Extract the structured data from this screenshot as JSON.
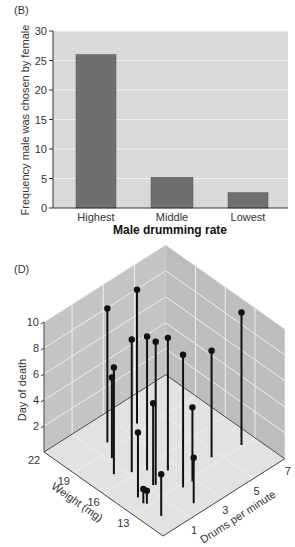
{
  "chart_data": [
    {
      "panel": "(B)",
      "type": "bar",
      "title": "",
      "xlabel": "Male drumming rate",
      "ylabel": "Frequency male was chosen by female",
      "categories": [
        "Highest",
        "Middle",
        "Lowest"
      ],
      "values": [
        26,
        5.2,
        2.6
      ],
      "ylim": [
        0,
        30
      ],
      "yticks": [
        0,
        5,
        10,
        15,
        20,
        25,
        30
      ],
      "grid": true,
      "colors": {
        "bar": "#6f6f6f",
        "background": "#d9d9d9",
        "grid": "#f2f2f2"
      }
    },
    {
      "panel": "(D)",
      "type": "scatter",
      "subtype": "3d-stem",
      "title": "",
      "xlabel": "Weight (mg)",
      "ylabel": "Drums per minute",
      "zlabel": "Day of death",
      "xticks": [
        22,
        19,
        16,
        13
      ],
      "yticks": [
        1,
        3,
        5,
        7
      ],
      "zticks": [
        2,
        4,
        6,
        8,
        10
      ],
      "xlim": [
        10,
        22
      ],
      "ylim": [
        -0.8,
        7
      ],
      "zlim": [
        0,
        10
      ],
      "grid": true,
      "points": [
        {
          "weight": 19.7,
          "drums": 1.8,
          "day": 10.3
        },
        {
          "weight": 19.7,
          "drums": 3.7,
          "day": 10.3
        },
        {
          "weight": 18.3,
          "drums": 1.2,
          "day": 6.2
        },
        {
          "weight": 17.0,
          "drums": 0.5,
          "day": 8.2
        },
        {
          "weight": 16.3,
          "drums": 1.2,
          "day": 10.2
        },
        {
          "weight": 15.7,
          "drums": 1.8,
          "day": 10.3
        },
        {
          "weight": 14.2,
          "drums": 1.4,
          "day": 11.0
        },
        {
          "weight": 14.7,
          "drums": 2.5,
          "day": 10.2
        },
        {
          "weight": 12.7,
          "drums": 2.2,
          "day": 10.2
        },
        {
          "weight": 13.6,
          "drums": 4.6,
          "day": 8.2
        },
        {
          "weight": 13.1,
          "drums": 6.2,
          "day": 10.2
        },
        {
          "weight": 14.3,
          "drums": 1.3,
          "day": 6.3
        },
        {
          "weight": 12.7,
          "drums": 2.8,
          "day": 5.7
        },
        {
          "weight": 14.1,
          "drums": 0.2,
          "day": 5.0
        },
        {
          "weight": 11.0,
          "drums": 1.8,
          "day": 3.5
        },
        {
          "weight": 11.6,
          "drums": 0.1,
          "day": 3.2
        },
        {
          "weight": 13.4,
          "drums": 0.1,
          "day": 1.1
        },
        {
          "weight": 13.2,
          "drums": 0.2,
          "day": 1.0
        }
      ],
      "colors": {
        "wall": "#c4c4c4",
        "floor": "#e2e2e2",
        "grid": "#efefef",
        "stem": "#111111"
      }
    }
  ],
  "labels": {
    "panel_b": "(B)",
    "panel_d": "(D)"
  }
}
